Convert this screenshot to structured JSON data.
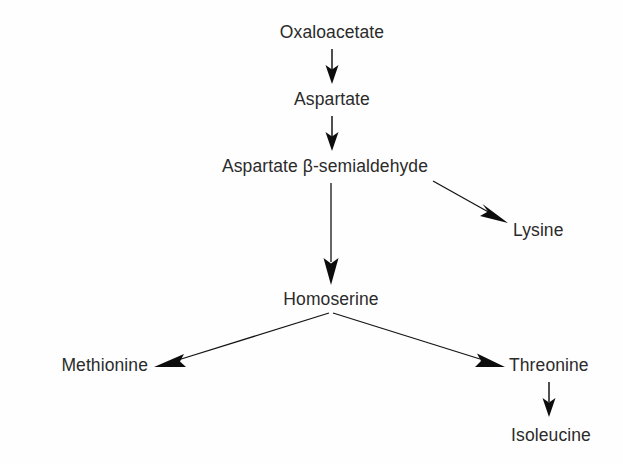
{
  "diagram": {
    "type": "flowchart",
    "background_color": "#fefefe",
    "text_color": "#2b2b2b",
    "arrow_color": "#0d0d0d",
    "nodes": [
      {
        "id": "oxaloacetate",
        "label": "Oxaloacetate",
        "x": 332,
        "y": 38
      },
      {
        "id": "aspartate",
        "label": "Aspartate",
        "x": 332,
        "y": 105
      },
      {
        "id": "aspartate-beta-semialdehyde",
        "label": "Aspartate β-semialdehyde",
        "x": 325,
        "y": 172
      },
      {
        "id": "lysine",
        "label": "Lysine",
        "x": 545,
        "y": 236
      },
      {
        "id": "homoserine",
        "label": "Homoserine",
        "x": 331,
        "y": 305
      },
      {
        "id": "methionine",
        "label": "Methionine",
        "x": 96,
        "y": 371
      },
      {
        "id": "threonine",
        "label": "Threonine",
        "x": 557,
        "y": 371
      },
      {
        "id": "isoleucine",
        "label": "Isoleucine",
        "x": 551,
        "y": 441
      }
    ],
    "edges": [
      {
        "id": "oxaloacetate-to-aspartate",
        "from": "Oxaloacetate",
        "to": "Aspartate",
        "direction": "down"
      },
      {
        "id": "aspartate-to-asa",
        "from": "Aspartate",
        "to": "Aspartate β-semialdehyde",
        "direction": "down"
      },
      {
        "id": "asa-to-homoserine",
        "from": "Aspartate β-semialdehyde",
        "to": "Homoserine",
        "direction": "down"
      },
      {
        "id": "asa-to-lysine",
        "from": "Aspartate β-semialdehyde",
        "to": "Lysine",
        "direction": "down-right"
      },
      {
        "id": "homoserine-to-methionine",
        "from": "Homoserine",
        "to": "Methionine",
        "direction": "down-left"
      },
      {
        "id": "homoserine-to-threonine",
        "from": "Homoserine",
        "to": "Threonine",
        "direction": "down-right"
      },
      {
        "id": "threonine-to-isoleucine",
        "from": "Threonine",
        "to": "Isoleucine",
        "direction": "down"
      }
    ]
  }
}
